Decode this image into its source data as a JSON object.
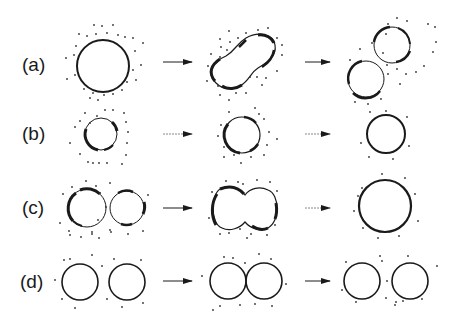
{
  "diagram": {
    "rows": [
      {
        "label": "(a)",
        "y": 65
      },
      {
        "label": "(b)",
        "y": 134
      },
      {
        "label": "(c)",
        "y": 208
      },
      {
        "label": "(d)",
        "y": 282
      }
    ],
    "colors": {
      "stroke": "#1a1a1a",
      "dot": "#333333",
      "background": "#ffffff"
    }
  }
}
